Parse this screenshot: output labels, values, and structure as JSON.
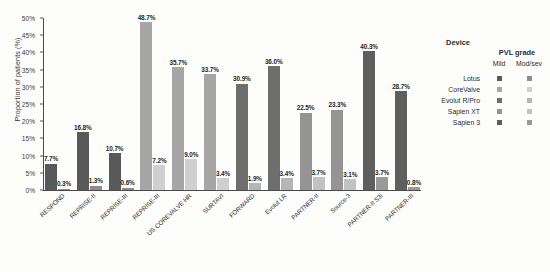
{
  "chart_data": {
    "type": "bar",
    "title": "",
    "xlabel": "",
    "ylabel": "Proportion of patients (%)",
    "ylim": [
      0,
      50
    ],
    "ytick_labels": [
      "0%",
      "5%",
      "10%",
      "15%",
      "20%",
      "25%",
      "30%",
      "35%",
      "40%",
      "45%",
      "50%"
    ],
    "ytick_values": [
      0,
      5,
      10,
      15,
      20,
      25,
      30,
      35,
      40,
      45,
      50
    ],
    "grid": false,
    "legend_position": "right",
    "categories": [
      "RESPOND",
      "REPRISE-II",
      "REPRISE-III",
      "REPRISE-III",
      "US COREVALVE HR",
      "SURTAVI",
      "FORWARD",
      "Evolut LR",
      "PARTNER-II",
      "Source-3",
      "PARTNER-II S3i",
      "PARTNER-III"
    ],
    "series": [
      {
        "name": "Mild",
        "values": [
          7.7,
          16.8,
          10.7,
          48.7,
          35.7,
          33.7,
          30.9,
          36.0,
          22.5,
          23.3,
          40.3,
          28.7
        ],
        "labels": [
          "7.7%",
          "16.8%",
          "10.7%",
          "48.7%",
          "35.7%",
          "33.7%",
          "30.9%",
          "36.0%",
          "22.5%",
          "23.3%",
          "40.3%",
          "28.7%"
        ]
      },
      {
        "name": "Mod/sev",
        "values": [
          0.3,
          1.3,
          0.6,
          7.2,
          9.0,
          3.4,
          1.9,
          3.4,
          3.7,
          3.1,
          3.7,
          0.8
        ],
        "labels": [
          "0.3%",
          "1.3%",
          "0.6%",
          "7.2%",
          "9.0%",
          "3.4%",
          "1.9%",
          "3.4%",
          "3.7%",
          "3.1%",
          "3.7%",
          "0.8%"
        ]
      }
    ],
    "group_devices": [
      "Lotus",
      "Lotus",
      "Lotus",
      "CoreValve",
      "CoreValve",
      "CoreValve",
      "Evolut R/Pro",
      "Evolut R/Pro",
      "Sapien XT",
      "Sapien XT",
      "Sapien 3",
      "Sapien 3"
    ],
    "device_colors": {
      "Lotus": {
        "mild": "#595959",
        "modsev": "#8c8c8c"
      },
      "CoreValve": {
        "mild": "#a6a6a6",
        "modsev": "#cfcfcf"
      },
      "Evolut R/Pro": {
        "mild": "#6e6e6e",
        "modsev": "#b5b5b5"
      },
      "Sapien XT": {
        "mild": "#949494",
        "modsev": "#c2c2c2"
      },
      "Sapien 3": {
        "mild": "#5f5f5f",
        "modsev": "#9a9a9a"
      }
    }
  },
  "legend": {
    "device_title": "Device",
    "pvl_title": "PVL grade",
    "col_mild": "Mild",
    "col_modsev": "Mod/sev",
    "devices": [
      {
        "name": "Lotus",
        "mild": "#595959",
        "modsev": "#8c8c8c"
      },
      {
        "name": "CoreValve",
        "mild": "#a6a6a6",
        "modsev": "#cfcfcf"
      },
      {
        "name": "Evolut R/Pro",
        "mild": "#6e6e6e",
        "modsev": "#b5b5b5"
      },
      {
        "name": "Sapien XT",
        "mild": "#949494",
        "modsev": "#c2c2c2"
      },
      {
        "name": "Sapien 3",
        "mild": "#5f5f5f",
        "modsev": "#9a9a9a"
      }
    ]
  }
}
